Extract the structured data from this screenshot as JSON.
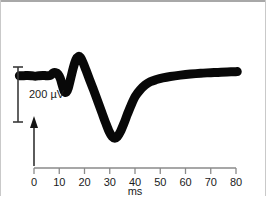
{
  "figure": {
    "kind": "electrophysiology-trace",
    "background_color": "#ffffff",
    "border_color": "#a8a8a8",
    "trace_color": "#080808"
  },
  "chart_data": {
    "type": "line",
    "title": "",
    "subtitle": "",
    "xlabel": "ms",
    "ylabel": "",
    "xlim": [
      0,
      80
    ],
    "grid": false,
    "legend": null,
    "xticks": [
      0,
      10,
      20,
      30,
      40,
      50,
      60,
      70,
      80
    ],
    "xtick_labels": [
      "0",
      "10",
      "20",
      "30",
      "40",
      "50",
      "60",
      "70",
      "80"
    ],
    "scale_bar": {
      "value": 200,
      "unit": "µV",
      "label": "200 µV",
      "orientation": "vertical"
    },
    "stimulus_marker": {
      "label": "",
      "time_ms": 0,
      "shape": "up-arrow"
    },
    "series": [
      {
        "name": "evoked potential",
        "units": "µV",
        "points_ms_uv": [
          [
            -5.8,
            52
          ],
          [
            -4.0,
            52
          ],
          [
            -2.5,
            53
          ],
          [
            -1.0,
            52
          ],
          [
            0.5,
            50
          ],
          [
            2.0,
            52
          ],
          [
            3.5,
            53
          ],
          [
            5.0,
            52
          ],
          [
            6.5,
            53
          ],
          [
            7.6,
            62
          ],
          [
            8.5,
            63
          ],
          [
            9.5,
            58
          ],
          [
            10.4,
            42
          ],
          [
            11.3,
            14
          ],
          [
            12.0,
            -5
          ],
          [
            12.8,
            -8
          ],
          [
            13.6,
            8
          ],
          [
            14.6,
            45
          ],
          [
            15.6,
            82
          ],
          [
            16.6,
            110
          ],
          [
            17.6,
            122
          ],
          [
            18.4,
            118
          ],
          [
            19.4,
            100
          ],
          [
            20.6,
            72
          ],
          [
            22.0,
            38
          ],
          [
            23.6,
            0
          ],
          [
            25.2,
            -40
          ],
          [
            26.8,
            -80
          ],
          [
            28.4,
            -120
          ],
          [
            29.8,
            -152
          ],
          [
            31.0,
            -170
          ],
          [
            32.0,
            -175
          ],
          [
            33.0,
            -170
          ],
          [
            34.2,
            -152
          ],
          [
            35.6,
            -122
          ],
          [
            37.0,
            -88
          ],
          [
            38.6,
            -52
          ],
          [
            40.2,
            -22
          ],
          [
            42.0,
            0
          ],
          [
            44.0,
            18
          ],
          [
            46.0,
            30
          ],
          [
            48.5,
            38
          ],
          [
            51.0,
            44
          ],
          [
            54.0,
            49
          ],
          [
            58.0,
            54
          ],
          [
            62.0,
            58
          ],
          [
            66.0,
            61
          ],
          [
            70.0,
            63
          ],
          [
            74.0,
            65
          ],
          [
            78.0,
            66
          ],
          [
            80.5,
            67
          ]
        ]
      }
    ]
  },
  "labels": {
    "scale_bar_text": "200 µV",
    "x_axis_title": "ms",
    "tick_0": "0",
    "tick_10": "10",
    "tick_20": "20",
    "tick_30": "30",
    "tick_40": "40",
    "tick_50": "50",
    "tick_60": "60",
    "tick_70": "70",
    "tick_80": "80"
  }
}
